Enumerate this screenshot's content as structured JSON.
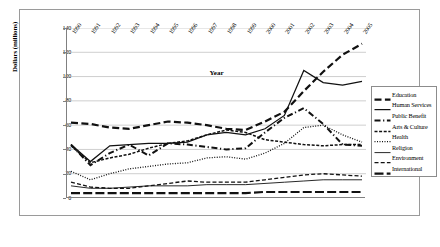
{
  "chart_data": {
    "type": "line",
    "title": "",
    "xlabel": "Year",
    "ylabel": "Dollars (millions)",
    "ylim": [
      0,
      140
    ],
    "ytick_step": 20,
    "yticks": [
      0,
      20,
      40,
      60,
      80,
      100,
      120,
      140
    ],
    "grid": true,
    "legend_position": "right",
    "categories": [
      "1990",
      "1991",
      "1992",
      "1993",
      "1994",
      "1995",
      "1996",
      "1997",
      "1998",
      "1999",
      "2000",
      "2001",
      "2002",
      "2003",
      "2004",
      "2005"
    ],
    "series": [
      {
        "name": "Education",
        "style": "thick-dash",
        "values": [
          62,
          61,
          58,
          57,
          60,
          63,
          62,
          60,
          57,
          56,
          63,
          71,
          88,
          104,
          118,
          127
        ]
      },
      {
        "name": "Human Services",
        "style": "solid",
        "values": [
          44,
          30,
          43,
          44,
          45,
          45,
          46,
          52,
          54,
          52,
          57,
          68,
          105,
          95,
          93,
          96
        ]
      },
      {
        "name": "Public Benefit",
        "style": "dash-dot",
        "values": [
          44,
          27,
          37,
          44,
          35,
          45,
          44,
          42,
          40,
          41,
          54,
          66,
          74,
          61,
          44,
          43
        ]
      },
      {
        "name": "Arts & Culture",
        "style": "short-dash",
        "values": [
          43,
          29,
          33,
          36,
          41,
          45,
          47,
          52,
          56,
          54,
          48,
          46,
          44,
          43,
          44,
          44
        ]
      },
      {
        "name": "Health",
        "style": "dotted",
        "values": [
          22,
          15,
          20,
          24,
          26,
          28,
          29,
          33,
          34,
          32,
          37,
          45,
          58,
          60,
          52,
          46
        ]
      },
      {
        "name": "Religion",
        "style": "thin-solid",
        "values": [
          10,
          8,
          8,
          9,
          10,
          10,
          10,
          11,
          11,
          11,
          12,
          13,
          14,
          15,
          15,
          15
        ]
      },
      {
        "name": "Environment",
        "style": "med-dash",
        "values": [
          13,
          9,
          8,
          8,
          10,
          12,
          14,
          13,
          13,
          13,
          15,
          17,
          19,
          20,
          19,
          18
        ]
      },
      {
        "name": "International",
        "style": "long-dash",
        "values": [
          4,
          4,
          4,
          4,
          4,
          4,
          4,
          4,
          4,
          4,
          5,
          5,
          5,
          5,
          5,
          5
        ]
      }
    ]
  },
  "legend": {
    "items": [
      {
        "label": "Education"
      },
      {
        "label": "Human Services"
      },
      {
        "label": "Public Benefit"
      },
      {
        "label": "Arts & Culture"
      },
      {
        "label": "Health"
      },
      {
        "label": "Religion"
      },
      {
        "label": "Environment"
      },
      {
        "label": "International"
      }
    ]
  }
}
